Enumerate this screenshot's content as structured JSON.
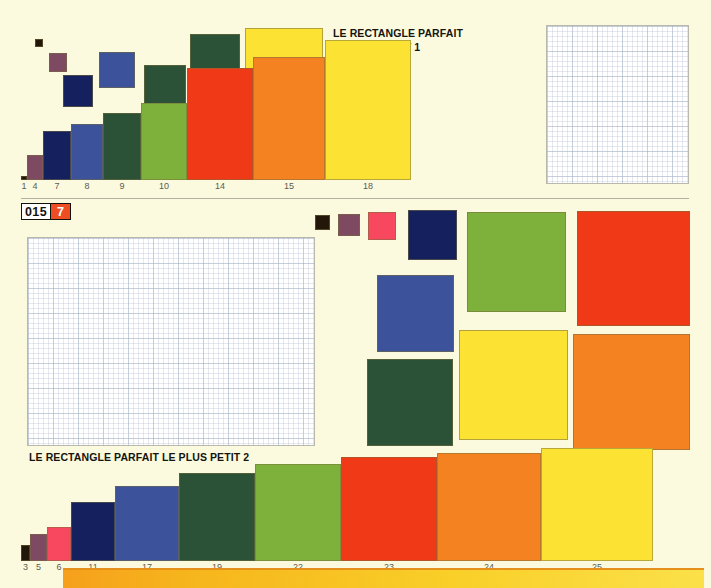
{
  "page": {
    "background_color": "#fbfade",
    "badge": {
      "number": "015",
      "page": "7",
      "page_bg": "#ef4e23"
    },
    "bottom_bar_colors": [
      "#f6a01c",
      "#fbe14a"
    ]
  },
  "palette": {
    "black": "#231709",
    "mauve": "#7e4a62",
    "pink": "#f8485f",
    "navy": "#14215e",
    "blue": "#3c529a",
    "darkgreen": "#2b5237",
    "green": "#7eb03c",
    "red": "#f03a17",
    "orange": "#f58220",
    "yellow": "#fbe233",
    "gridwhite": "#ffffff"
  },
  "section_top": {
    "title_line1": "LE RECTANGLE PARFAIT",
    "title_line2": "LE PLUS PETIT 1",
    "chart_data": {
      "type": "bar",
      "title": "LE RECTANGLE PARFAIT LE PLUS PETIT 1",
      "xlabel": "",
      "ylabel": "",
      "grid": false,
      "legend": "none",
      "categories": [
        "1",
        "4",
        "7",
        "8",
        "9",
        "10",
        "14",
        "15",
        "18"
      ],
      "values": [
        3,
        18,
        35,
        40,
        48,
        55,
        80,
        88,
        100
      ],
      "ylim": [
        0,
        100
      ],
      "colors": [
        "#231709",
        "#7e4a62",
        "#14215e",
        "#3c529a",
        "#2b5237",
        "#7eb03c",
        "#f03a17",
        "#f58220",
        "#fbe233"
      ],
      "widths": [
        6,
        16,
        28,
        32,
        38,
        46,
        66,
        72,
        86
      ]
    },
    "floating_squares": [
      {
        "name": "square-black",
        "color": "#231709",
        "x": 35,
        "y": 39,
        "w": 8,
        "h": 8
      },
      {
        "name": "square-mauve",
        "color": "#7e4a62",
        "x": 49,
        "y": 53,
        "w": 18,
        "h": 19
      },
      {
        "name": "square-navy",
        "color": "#14215e",
        "x": 63,
        "y": 75,
        "w": 30,
        "h": 32
      },
      {
        "name": "square-blue",
        "color": "#3c529a",
        "x": 99,
        "y": 52,
        "w": 36,
        "h": 36
      },
      {
        "name": "square-darkgreen",
        "color": "#2b5237",
        "x": 144,
        "y": 65,
        "w": 42,
        "h": 45
      },
      {
        "name": "square-green",
        "color": "#2b5237",
        "x": 190,
        "y": 34,
        "w": 50,
        "h": 51
      },
      {
        "name": "square-yellow",
        "color": "#fbe233",
        "x": 245,
        "y": 28,
        "w": 78,
        "h": 88
      },
      {
        "name": "square-gridpaper",
        "color": "#ffffff",
        "x": 546,
        "y": 25,
        "w": 143,
        "h": 159
      }
    ]
  },
  "section_bottom": {
    "title": "LE RECTANGLE PARFAIT LE PLUS PETIT 2",
    "chart_data": {
      "type": "bar",
      "title": "LE RECTANGLE PARFAIT LE PLUS PETIT 2",
      "xlabel": "",
      "ylabel": "",
      "grid": false,
      "legend": "none",
      "categories": [
        "3",
        "5",
        "6",
        "11",
        "17",
        "19",
        "22",
        "23",
        "24",
        "25"
      ],
      "values": [
        14,
        24,
        30,
        52,
        66,
        78,
        86,
        92,
        96,
        100
      ],
      "ylim": [
        0,
        100
      ],
      "colors": [
        "#231709",
        "#7e4a62",
        "#f8485f",
        "#14215e",
        "#3c529a",
        "#2b5237",
        "#7eb03c",
        "#f03a17",
        "#f58220",
        "#fbe233"
      ],
      "widths": [
        9,
        17,
        24,
        44,
        64,
        76,
        86,
        96,
        104,
        112
      ]
    },
    "floating_squares": [
      {
        "name": "square-gridpaper",
        "color": "#ffffff",
        "x": 27,
        "y": 237,
        "w": 288,
        "h": 209
      },
      {
        "name": "square-black",
        "color": "#231709",
        "x": 315,
        "y": 215,
        "w": 15,
        "h": 15
      },
      {
        "name": "square-mauve",
        "color": "#7e4a62",
        "x": 338,
        "y": 214,
        "w": 22,
        "h": 22
      },
      {
        "name": "square-pink",
        "color": "#f8485f",
        "x": 368,
        "y": 212,
        "w": 28,
        "h": 28
      },
      {
        "name": "square-navy",
        "color": "#14215e",
        "x": 408,
        "y": 210,
        "w": 49,
        "h": 50
      },
      {
        "name": "square-blue",
        "color": "#3c529a",
        "x": 377,
        "y": 275,
        "w": 77,
        "h": 77
      },
      {
        "name": "square-darkgreen",
        "color": "#2b5237",
        "x": 367,
        "y": 359,
        "w": 86,
        "h": 87
      },
      {
        "name": "square-green",
        "color": "#7eb03c",
        "x": 467,
        "y": 212,
        "w": 99,
        "h": 100
      },
      {
        "name": "square-yellow",
        "color": "#fbe233",
        "x": 459,
        "y": 330,
        "w": 109,
        "h": 110
      },
      {
        "name": "square-red",
        "color": "#f03a17",
        "x": 577,
        "y": 211,
        "w": 113,
        "h": 115
      },
      {
        "name": "square-orange",
        "color": "#f58220",
        "x": 573,
        "y": 334,
        "w": 117,
        "h": 116
      }
    ]
  }
}
